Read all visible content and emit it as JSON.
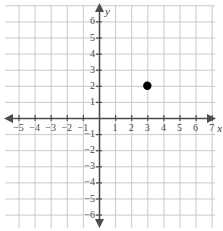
{
  "chart_data": {
    "type": "scatter",
    "title": "",
    "xlabel": "x",
    "ylabel": "y",
    "xlim": [
      -5.9,
      7.6
    ],
    "ylim": [
      -7.1,
      6.9
    ],
    "grid": true,
    "legend": false,
    "x_ticks": [
      -5,
      -4,
      -3,
      -2,
      -1,
      1,
      2,
      3,
      4,
      5,
      6,
      7
    ],
    "y_ticks": [
      6,
      5,
      4,
      3,
      2,
      1,
      -1,
      -2,
      -3,
      -4,
      -5,
      -6
    ],
    "x_tick_labels": [
      "−5",
      "−4",
      "−3",
      "−2",
      "−1",
      "1",
      "2",
      "3",
      "4",
      "5",
      "6",
      "7"
    ],
    "y_tick_labels": [
      "6",
      "5",
      "4",
      "3",
      "2",
      "1",
      "−1",
      "−2",
      "−3",
      "−4",
      "−5",
      "−6"
    ],
    "points": [
      {
        "x": 3,
        "y": 2,
        "label": ""
      }
    ],
    "series": [
      {
        "name": "plotted-point",
        "values": [
          [
            3,
            2
          ]
        ]
      }
    ]
  },
  "axes": {
    "x_axis_name": "x",
    "y_axis_name": "y"
  },
  "colors": {
    "grid": "#c9c9c9",
    "axis": "#4d4d4d",
    "point": "#000000",
    "label": "#4a4a4a",
    "background": "#ffffff"
  },
  "geometry": {
    "origin_x": 99,
    "origin_y": 118,
    "unit": 16.1,
    "point_radius": 4.2
  }
}
